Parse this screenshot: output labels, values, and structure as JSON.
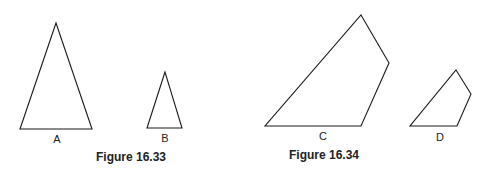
{
  "figures": [
    {
      "caption": "Figure 16.33",
      "shapes": [
        {
          "label": "A",
          "type": "triangle",
          "points": "56,23 20,129 92,129"
        },
        {
          "label": "B",
          "type": "triangle",
          "points": "165,72 147,128 182,128"
        }
      ]
    },
    {
      "caption": "Figure 16.34",
      "shapes": [
        {
          "label": "C",
          "type": "quadrilateral",
          "points": "361,15 389,63 361,126 265,126"
        },
        {
          "label": "D",
          "type": "quadrilateral",
          "points": "456,70 471,94 457,126 410,126"
        }
      ]
    }
  ],
  "colors": {
    "stroke": "#1a1a1a",
    "text": "#222222",
    "background": "#ffffff"
  }
}
